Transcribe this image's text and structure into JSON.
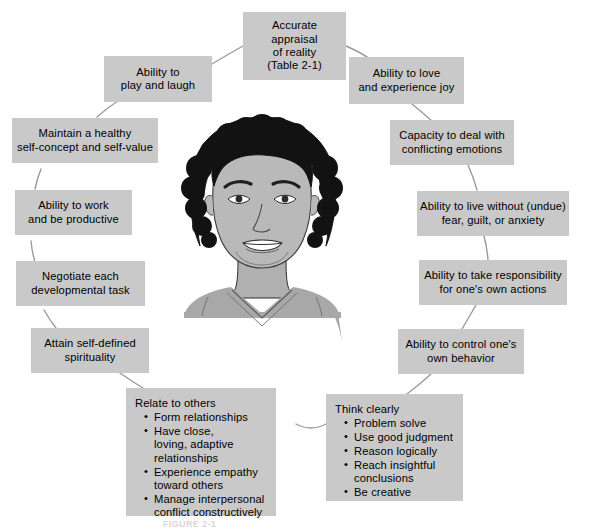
{
  "figure": {
    "canvas_width": 589,
    "canvas_height": 529,
    "background_color": "#ffffff",
    "box_fill_color": "#c9c9c9",
    "box_text_color": "#000000",
    "connector_color": "#9a9a9a",
    "caption_partial": "FIGURE 2-1"
  },
  "center": {
    "name": "portrait-illustration",
    "description": "Grayscale line-art portrait of a smiling person with short curly dark hair wearing a v-neck top",
    "hair_color": "#1a1a1a",
    "skin_color": "#b9b9b9",
    "shirt_color": "#a8a8a8"
  },
  "nodes": [
    {
      "id": "accurate-appraisal",
      "title": "Accurate\nappraisal\nof reality\n(Table 2-1)",
      "bullets": []
    },
    {
      "id": "ability-to-love",
      "title": "Ability to love\nand experience joy",
      "bullets": []
    },
    {
      "id": "capacity-conflicting-emotions",
      "title": "Capacity to deal with\nconflicting emotions",
      "bullets": []
    },
    {
      "id": "live-without-fear",
      "title": "Ability to live without (undue)\nfear, guilt, or anxiety",
      "bullets": []
    },
    {
      "id": "take-responsibility",
      "title": "Ability to take responsibility\nfor one's own actions",
      "bullets": []
    },
    {
      "id": "control-own-behavior",
      "title": "Ability to control one's\nown behavior",
      "bullets": []
    },
    {
      "id": "think-clearly",
      "title": "Think clearly",
      "bullets": [
        "Problem solve",
        "Use good judgment",
        "Reason logically",
        "Reach insightful\nconclusions",
        "Be creative"
      ]
    },
    {
      "id": "relate-to-others",
      "title": "Relate to others",
      "bullets": [
        "Form relationships",
        "Have close,\nloving, adaptive\nrelationships",
        "Experience empathy\ntoward others",
        "Manage interpersonal\nconflict constructively"
      ]
    },
    {
      "id": "attain-spirituality",
      "title": "Attain self-defined\nspirituality",
      "bullets": []
    },
    {
      "id": "negotiate-developmental-task",
      "title": "Negotiate each\ndevelopmental task",
      "bullets": []
    },
    {
      "id": "work-productive",
      "title": "Ability to work\nand be productive",
      "bullets": []
    },
    {
      "id": "healthy-self-concept",
      "title": "Maintain a healthy\nself-concept and self-value",
      "bullets": []
    },
    {
      "id": "play-and-laugh",
      "title": "Ability to\nplay and laugh",
      "bullets": []
    }
  ]
}
